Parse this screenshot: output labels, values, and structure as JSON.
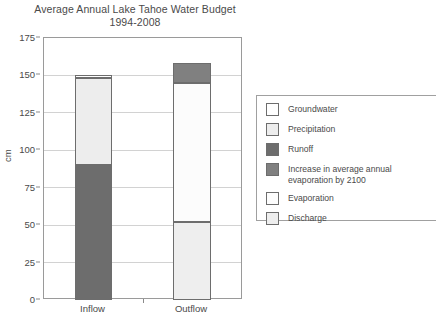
{
  "chart_data": {
    "type": "bar",
    "subtype": "stacked",
    "title": "Average Annual Lake Tahoe Water Budget",
    "subtitle": "1994-2008",
    "xlabel": "",
    "ylabel": "cm",
    "ylim": [
      0,
      175
    ],
    "yticks": [
      0,
      25,
      50,
      75,
      100,
      125,
      150,
      175
    ],
    "ytick_labels": [
      "0",
      "25",
      "50",
      "75",
      "100",
      "125",
      "150",
      "175"
    ],
    "grid": true,
    "grid_axis": "y",
    "legend_position": "right",
    "categories": [
      "Inflow",
      "Outflow"
    ],
    "series": [
      {
        "name": "Groundwater",
        "values": [
          2,
          0
        ],
        "color": "#ffffff"
      },
      {
        "name": "Precipitation",
        "values": [
          58,
          0
        ],
        "color": "#ededed"
      },
      {
        "name": "Runoff",
        "values": [
          90,
          0
        ],
        "color": "#6d6d6d"
      },
      {
        "name": "Increase in average annual evaporation by 2100",
        "values": [
          0,
          13
        ],
        "color": "#808080"
      },
      {
        "name": "Evaporation",
        "values": [
          0,
          93
        ],
        "color": "#fcfcfc"
      },
      {
        "name": "Discharge",
        "values": [
          0,
          52
        ],
        "color": "#eeeeee"
      }
    ],
    "stacks": {
      "Inflow": [
        {
          "label": "Runoff",
          "from": 0,
          "to": 90,
          "value": 90
        },
        {
          "label": "Precipitation",
          "from": 90,
          "to": 148,
          "value": 58
        },
        {
          "label": "Groundwater",
          "from": 148,
          "to": 150,
          "value": 2
        }
      ],
      "Outflow": [
        {
          "label": "Discharge",
          "from": 0,
          "to": 52,
          "value": 52
        },
        {
          "label": "Evaporation",
          "from": 52,
          "to": 145,
          "value": 93
        },
        {
          "label": "Increase in average annual evaporation by 2100",
          "from": 145,
          "to": 158,
          "value": 13
        }
      ]
    },
    "totals": {
      "Inflow": 150,
      "Outflow": 158
    }
  },
  "legend": {
    "items": [
      {
        "label": "Groundwater",
        "color": "#ffffff"
      },
      {
        "label": "Precipitation",
        "color": "#ededed"
      },
      {
        "label": "Runoff",
        "color": "#6d6d6d"
      },
      {
        "label": "Increase in average annual\nevaporation by 2100",
        "color": "#808080"
      },
      {
        "label": "Evaporation",
        "color": "#fdfdfd"
      },
      {
        "label": "Discharge",
        "color": "#eeeeee"
      }
    ]
  }
}
